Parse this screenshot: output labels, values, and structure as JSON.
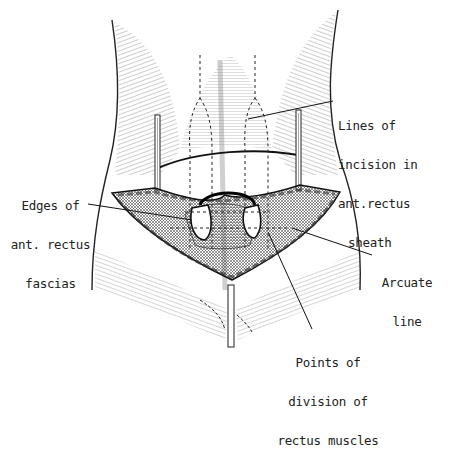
{
  "figure": {
    "labels": {
      "lines_of_incision": [
        "Lines of",
        "incision in",
        "ant.rectus",
        "sheath"
      ],
      "edges_of_fascias": [
        "Edges of",
        "ant. rectus",
        "fascias"
      ],
      "arcuate_line": [
        "Arcuate",
        "line"
      ],
      "points_of_division": [
        "Points of",
        "division of",
        "rectus muscles"
      ]
    }
  }
}
